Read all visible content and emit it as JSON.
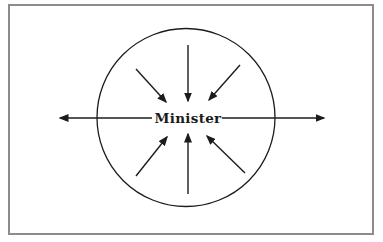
{
  "diagram": {
    "type": "radial-pressure-diagram",
    "center_label": "Minister",
    "colors": {
      "line": "#1c1c1c",
      "frame_border": "#8c8c8c",
      "background": "#ffffff"
    },
    "frame": {
      "x": 9,
      "y": 5,
      "width": 364,
      "height": 229
    },
    "circle": {
      "cx": 186,
      "cy": 117.5,
      "r": 89
    },
    "label_position": {
      "x": 188,
      "y": 122.5
    },
    "arrows": [
      {
        "name": "arrow-outward-left",
        "direction": "outward",
        "x1": 152,
        "y1": 118,
        "x2": 60,
        "y2": 118
      },
      {
        "name": "arrow-outward-right",
        "direction": "outward",
        "x1": 222,
        "y1": 118,
        "x2": 324,
        "y2": 118
      },
      {
        "name": "arrow-inward-top",
        "direction": "inward",
        "x1": 188,
        "y1": 45,
        "x2": 188,
        "y2": 101
      },
      {
        "name": "arrow-inward-upper-left",
        "direction": "inward",
        "x1": 136,
        "y1": 69,
        "x2": 166,
        "y2": 102
      },
      {
        "name": "arrow-inward-upper-right",
        "direction": "inward",
        "x1": 240,
        "y1": 65,
        "x2": 209,
        "y2": 100
      },
      {
        "name": "arrow-inward-bottom",
        "direction": "inward",
        "x1": 188,
        "y1": 194,
        "x2": 188,
        "y2": 134
      },
      {
        "name": "arrow-inward-lower-left",
        "direction": "inward",
        "x1": 136,
        "y1": 176,
        "x2": 167,
        "y2": 137
      },
      {
        "name": "arrow-inward-lower-right",
        "direction": "inward",
        "x1": 245,
        "y1": 173,
        "x2": 207,
        "y2": 136
      }
    ]
  }
}
